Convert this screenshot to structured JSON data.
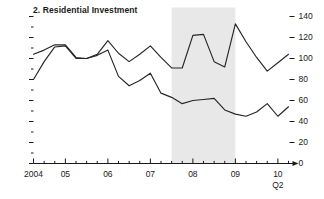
{
  "chart_data": {
    "type": "line",
    "title": "2. Residential Investment",
    "xlabel": "",
    "ylabel": "",
    "ylim": [
      0,
      140
    ],
    "yticks": [
      0,
      20,
      40,
      60,
      80,
      100,
      120,
      140
    ],
    "ytick_labels": [
      "0",
      "20",
      "40",
      "60",
      "80",
      "100",
      "120",
      "140"
    ],
    "y_axis_position": "right",
    "left_axis_ticks_unlabeled": true,
    "grid": false,
    "legend": "none",
    "xlim": [
      "2004:Q2",
      "2010:Q2"
    ],
    "xtick_labels": [
      "2004",
      "05",
      "06",
      "07",
      "08",
      "09",
      "10"
    ],
    "xtick_sublabel": "Q2",
    "x_minor_ticks": "quarterly",
    "x": [
      "2004:Q2",
      "2004:Q3",
      "2004:Q4",
      "2005:Q1",
      "2005:Q2",
      "2005:Q3",
      "2005:Q4",
      "2006:Q1",
      "2006:Q2",
      "2006:Q3",
      "2006:Q4",
      "2007:Q1",
      "2007:Q2",
      "2007:Q3",
      "2007:Q4",
      "2008:Q1",
      "2008:Q2",
      "2008:Q3",
      "2008:Q4",
      "2009:Q1",
      "2009:Q2",
      "2009:Q3",
      "2009:Q4",
      "2010:Q1",
      "2010:Q2"
    ],
    "series": [
      {
        "name": "upper-line",
        "values": [
          104,
          108,
          113,
          113,
          101,
          100,
          104,
          117,
          105,
          97,
          104,
          112,
          101,
          91,
          91,
          122,
          123,
          97,
          92,
          133,
          116,
          101,
          88,
          96,
          104
        ]
      },
      {
        "name": "lower-line",
        "values": [
          80,
          97,
          111,
          112,
          100,
          100,
          103,
          108,
          83,
          74,
          79,
          86,
          67,
          63,
          57,
          60,
          61,
          62,
          51,
          47,
          45,
          49,
          57,
          45,
          54
        ]
      }
    ],
    "shaded_region": {
      "label": "recession-band",
      "start": "2007:Q3",
      "end": "2009:Q1",
      "color": "#e8e8e8"
    },
    "colors": {
      "line": "#262626",
      "axis": "#1a1a1a",
      "shading": "#e8e8e8",
      "background": "#ffffff"
    }
  }
}
